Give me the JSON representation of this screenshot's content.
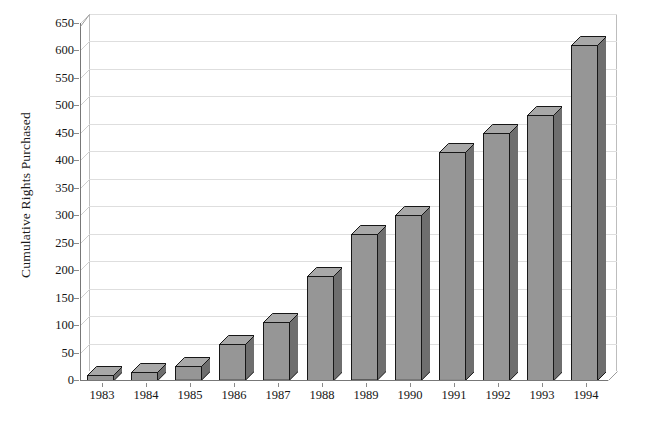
{
  "chart_data": {
    "type": "bar",
    "title": "",
    "xlabel": "",
    "ylabel": "Cumulative Rights Purchased",
    "categories": [
      "1983",
      "1984",
      "1985",
      "1986",
      "1987",
      "1988",
      "1989",
      "1990",
      "1991",
      "1992",
      "1993",
      "1994"
    ],
    "values": [
      10,
      15,
      25,
      65,
      105,
      190,
      265,
      300,
      415,
      450,
      483,
      610
    ],
    "ylim": [
      0,
      650
    ],
    "ytick_labels": [
      "0",
      "50",
      "100",
      "150",
      "200",
      "250",
      "300",
      "350",
      "400",
      "450",
      "500",
      "550",
      "600",
      "650"
    ],
    "ytick_values": [
      0,
      50,
      100,
      150,
      200,
      250,
      300,
      350,
      400,
      450,
      500,
      550,
      600,
      650
    ],
    "grid": true,
    "legend": "none",
    "style": "3d-column",
    "bar_fill_color": "#969696",
    "bar_edge_color": "#171717",
    "bar_top_color": "#a8a8a8",
    "bar_side_color": "#6e6e6e",
    "gridline_color": "#dedede",
    "axis_color": "#777777",
    "background_color": "#ffffff"
  },
  "figure": {
    "top_caption": ""
  }
}
